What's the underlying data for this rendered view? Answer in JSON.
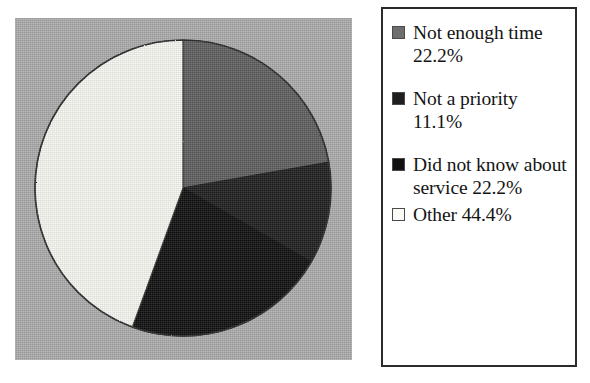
{
  "chart_data": {
    "type": "pie",
    "title": "",
    "categories": [
      "Not enough time",
      "Not a priority",
      "Did not know about service",
      "Other"
    ],
    "values": [
      22.2,
      11.1,
      22.2,
      44.4
    ],
    "value_unit": "%",
    "legend_position": "right",
    "grid": false,
    "start_angle_deg": 0,
    "direction": "clockwise",
    "slice_colors": [
      "#5b5b5b",
      "#1d1d1d",
      "#0d0d0d",
      "#f5f5f0"
    ],
    "plot_background": "#a9a9a9",
    "slices": [
      {
        "label": "Not enough time",
        "value": 22.2,
        "color": "#5b5b5b",
        "swatch": "#6e6e6e",
        "start_deg": 0,
        "end_deg": 80
      },
      {
        "label": "Not a priority",
        "value": 11.1,
        "color": "#1d1d1d",
        "swatch": "#1f1f1f",
        "start_deg": 80,
        "end_deg": 120
      },
      {
        "label": "Did not know about service",
        "value": 22.2,
        "color": "#0d0d0d",
        "swatch": "#111111",
        "start_deg": 120,
        "end_deg": 200
      },
      {
        "label": "Other",
        "value": 44.4,
        "color": "#f5f5f0",
        "swatch": "#fbfbf8",
        "start_deg": 200,
        "end_deg": 360
      }
    ]
  },
  "legend": {
    "items": [
      {
        "text": "Not enough time 22.2%",
        "swatch_color": "#6e6e6e"
      },
      {
        "text": "Not a priority 11.1%",
        "swatch_color": "#1f1f1f"
      },
      {
        "text": "Did not know about service 22.2%",
        "swatch_color": "#111111"
      },
      {
        "text": "Other 44.4%",
        "swatch_color": "#fbfbf8"
      }
    ]
  }
}
